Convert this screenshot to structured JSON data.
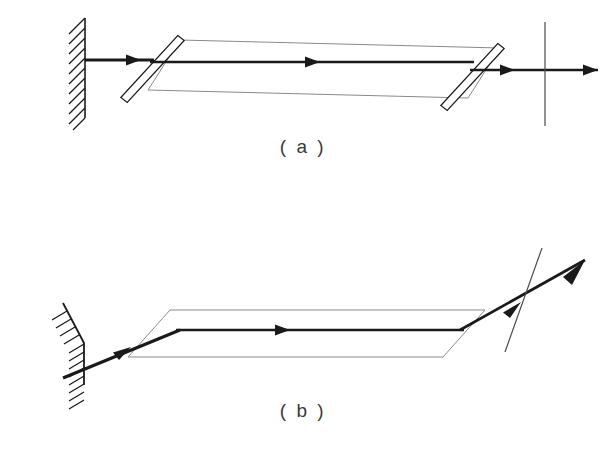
{
  "figure": {
    "type": "optics-ray-diagram",
    "background_color": "#ffffff",
    "ink_color": "#1a1a1a",
    "outline_color": "#8a8a8a",
    "caption_color": "#3a3a3a",
    "width": 613,
    "height": 470,
    "panels": [
      {
        "id": "panel-a",
        "caption": "( a )",
        "caption_x": 303,
        "caption_y": 148,
        "description": "normal incidence beam path with two beam splitters",
        "wall": {
          "orientation": "vertical",
          "x1": 85,
          "y1": 18,
          "x2": 85,
          "y2": 118,
          "hatch_side": "left",
          "hatch_count": 11,
          "hatch_length": 16,
          "hatch_angle_deg": 45
        },
        "beams": [
          {
            "name": "incident-beam",
            "x1": 85,
            "y1": 60,
            "x2": 152,
            "y2": 60,
            "arrow_at": 0.62,
            "arrow_angle_deg": 0
          },
          {
            "name": "internal-beam",
            "x1": 152,
            "y1": 62,
            "x2": 472,
            "y2": 62,
            "arrow_at": 0.53,
            "arrow_angle_deg": 0
          },
          {
            "name": "exit-beam",
            "x1": 472,
            "y1": 70,
            "x2": 598,
            "y2": 70,
            "arrow_at": 0.36,
            "arrow_angle_deg": 0
          }
        ],
        "envelope": {
          "name": "beam-envelope-parallelogram",
          "points": "180,40 500,48 468,98 148,90"
        },
        "splitters": [
          {
            "name": "beam-splitter-left",
            "x1": 181,
            "y1": 38,
            "x2": 124,
            "y2": 100,
            "thickness": 6
          },
          {
            "name": "beam-splitter-right",
            "x1": 501,
            "y1": 46,
            "x2": 444,
            "y2": 108,
            "thickness": 6
          }
        ],
        "detector_line": {
          "name": "detector-plane",
          "x1": 545,
          "y1": 22,
          "x2": 545,
          "y2": 126,
          "orientation": "vertical"
        }
      },
      {
        "id": "panel-b",
        "caption": "( b )",
        "caption_x": 303,
        "caption_y": 412,
        "description": "oblique incidence beam path with tilted mirror and tilted detector",
        "wall": {
          "orientation": "tilted",
          "x1": 84,
          "y1": 343,
          "x2": 63,
          "y2": 303,
          "x3": 84,
          "y3": 343,
          "x4": 84,
          "y4": 385,
          "hatch_side": "left",
          "hatch_count": 12,
          "hatch_length": 15,
          "hatch_angle_deg": 30
        },
        "beams": [
          {
            "name": "incident-beam",
            "x1": 63,
            "y1": 378,
            "x2": 178,
            "y2": 330,
            "arrow_at": 0.56,
            "arrow_angle_deg": -22
          },
          {
            "name": "internal-beam",
            "x1": 178,
            "y1": 330,
            "x2": 462,
            "y2": 330,
            "arrow_at": 0.5,
            "arrow_angle_deg": 0
          },
          {
            "name": "exit-beam",
            "x1": 462,
            "y1": 330,
            "x2": 582,
            "y2": 262,
            "arrow_at": 0.47,
            "arrow_angle_deg": -30
          }
        ],
        "envelope": {
          "name": "beam-envelope-parallelogram",
          "points": "170,310 485,310 443,357 128,357"
        },
        "detector_line": {
          "name": "detector-plane",
          "x1": 542,
          "y1": 248,
          "x2": 505,
          "y2": 352,
          "orientation": "tilted"
        }
      }
    ]
  }
}
